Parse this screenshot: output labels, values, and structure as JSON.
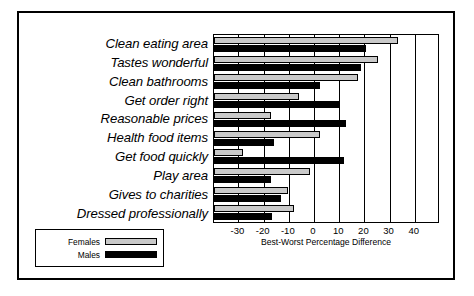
{
  "chart_data": {
    "type": "bar",
    "orientation": "horizontal",
    "title": "",
    "xlabel": "Best-Worst Percentage Difference",
    "ylabel": "",
    "xlim": [
      -39.7,
      50.0
    ],
    "xticks": [
      -30,
      -20,
      -10,
      0,
      10,
      20,
      30,
      40
    ],
    "xticklabels": [
      "-30",
      "-20",
      "-10",
      "0",
      "10",
      "20",
      "30",
      "40"
    ],
    "grid": "vertical",
    "legend_position": "below-left-outside",
    "categories": [
      "Clean eating area",
      "Tastes wonderful",
      "Clean bathrooms",
      "Get order right",
      "Reasonable prices",
      "Health food items",
      "Get food quickly",
      "Play area",
      "Gives to charities",
      "Dressed professionally"
    ],
    "series": [
      {
        "name": "Females",
        "color": "#c9c9c9",
        "values": [
          33.5,
          25.5,
          17.5,
          -6.0,
          -17.0,
          2.5,
          -28.0,
          -1.5,
          -10.5,
          -8.0
        ]
      },
      {
        "name": "Males",
        "color": "#000000",
        "values": [
          20.5,
          18.5,
          2.5,
          10.0,
          12.5,
          -16.0,
          12.0,
          -17.0,
          -13.0,
          -16.5
        ]
      }
    ]
  },
  "legend": {
    "items": [
      {
        "label": "Females",
        "swatch": "female"
      },
      {
        "label": "Males",
        "swatch": "male"
      }
    ]
  }
}
